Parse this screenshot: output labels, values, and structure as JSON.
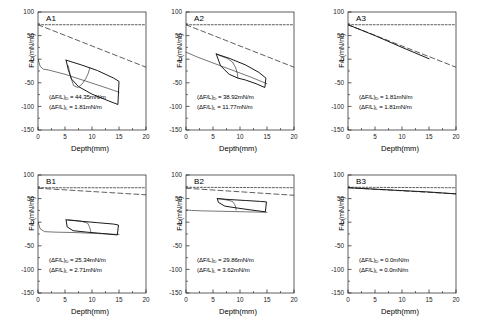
{
  "figure": {
    "width": 493,
    "height": 328,
    "background": "#ffffff",
    "line_color": "#1a1a1a",
    "rows": 2,
    "cols": 3
  },
  "axes": {
    "xlabel": "Depth(mm)",
    "ylabel": "F/L(mN/m)",
    "xticks": [
      0,
      5,
      10,
      15,
      20
    ],
    "yticks": [
      100,
      50,
      0,
      -50,
      -100,
      -150
    ],
    "xlim": [
      0,
      20
    ],
    "ylim": [
      -150,
      100
    ],
    "xtick_labels": [
      "0",
      "5",
      "10",
      "15",
      "20"
    ],
    "ytick_labels": [
      "100",
      "50",
      "0",
      "-50",
      "-100",
      "-150"
    ],
    "grid": false
  },
  "annotation_labels": {
    "delta_d_prefix": "(ΔF/L)",
    "delta_d_sub": "D",
    "delta_l_prefix": "(ΔF/L)",
    "delta_l_sub": "L",
    "equals": " = "
  },
  "chart_data": [
    {
      "id": "A1",
      "type": "line",
      "title": "A1",
      "xlabel": "Depth(mm)",
      "ylabel": "F/L(mN/m)",
      "xlim": [
        0,
        20
      ],
      "ylim": [
        -150,
        100
      ],
      "grid": false,
      "annotations": [
        {
          "label": "(ΔF/L)D",
          "value": "44.35mN/m",
          "text": "(ΔF/L)D = 44.35mN/m"
        },
        {
          "label": "(ΔF/L)L",
          "value": "1.81mN/m",
          "text": "(ΔF/L)L = 1.81mN/m"
        }
      ],
      "series": [
        {
          "name": "reference-horizontal-dashed",
          "style": "dashed",
          "x": [
            0,
            20
          ],
          "y": [
            73,
            73
          ]
        },
        {
          "name": "baseline-descending-dashed",
          "style": "dashed-long",
          "x": [
            0,
            20
          ],
          "y": [
            73,
            -17
          ]
        },
        {
          "name": "initial-descent-solid",
          "style": "solid-thin",
          "x": [
            0,
            0.4,
            1.0,
            2.0,
            5.0,
            9.0,
            13.0,
            15.0
          ],
          "y": [
            0,
            -15,
            -21,
            -23,
            -32,
            -47,
            -62,
            -70
          ]
        },
        {
          "name": "hysteresis-loop-outer",
          "style": "solid",
          "x": [
            5.2,
            8.0,
            11.0,
            14.0,
            15.0,
            14.8,
            13.0,
            10.0,
            7.5,
            6.2,
            5.6,
            5.2
          ],
          "y": [
            -2,
            -12,
            -24,
            -40,
            -47,
            -96,
            -88,
            -74,
            -58,
            -42,
            -22,
            -2
          ]
        },
        {
          "name": "hysteresis-loop-inner",
          "style": "solid-thin",
          "x": [
            9.6,
            9.3,
            8.8,
            8.2,
            7.4,
            6.6,
            6.0,
            5.6
          ],
          "y": [
            -18,
            -30,
            -42,
            -52,
            -60,
            -56,
            -36,
            -14
          ]
        }
      ]
    },
    {
      "id": "A2",
      "type": "line",
      "title": "A2",
      "xlabel": "Depth(mm)",
      "ylabel": "F/L(mN/m)",
      "xlim": [
        0,
        20
      ],
      "ylim": [
        -150,
        100
      ],
      "grid": false,
      "annotations": [
        {
          "label": "(ΔF/L)D",
          "value": "38.92mN/m",
          "text": "(ΔF/L)D = 38.92mN/m"
        },
        {
          "label": "(ΔF/L)L",
          "value": "11.77mN/m",
          "text": "(ΔF/L)L = 11.77mN/m"
        }
      ],
      "series": [
        {
          "name": "reference-horizontal-dashed",
          "style": "dashed",
          "x": [
            0,
            20
          ],
          "y": [
            73,
            73
          ]
        },
        {
          "name": "baseline-descending-dashed",
          "style": "dashed-long",
          "x": [
            0,
            20
          ],
          "y": [
            73,
            -17
          ]
        },
        {
          "name": "initial-descent-solid",
          "style": "solid-thin",
          "x": [
            0,
            2.0,
            5.0,
            9.0,
            12.0,
            15.0
          ],
          "y": [
            15,
            5,
            -8,
            -25,
            -38,
            -52
          ]
        },
        {
          "name": "hysteresis-loop-outer",
          "style": "solid",
          "x": [
            5.6,
            8.0,
            11.0,
            13.5,
            14.8,
            14.6,
            13.0,
            11.0,
            9.6,
            8.0,
            6.4,
            5.6
          ],
          "y": [
            11,
            2,
            -12,
            -28,
            -40,
            -60,
            -52,
            -44,
            -40,
            -32,
            -14,
            11
          ]
        },
        {
          "name": "hysteresis-loop-inner",
          "style": "solid-thin",
          "x": [
            9.6,
            9.5,
            9.2,
            8.6,
            7.6,
            6.6,
            6.0,
            5.7
          ],
          "y": [
            -40,
            -30,
            -18,
            -6,
            2,
            6,
            9,
            11
          ]
        }
      ]
    },
    {
      "id": "A3",
      "type": "line",
      "title": "A3",
      "xlabel": "Depth(mm)",
      "ylabel": "F/L(mN/m)",
      "xlim": [
        0,
        20
      ],
      "ylim": [
        -150,
        100
      ],
      "grid": false,
      "annotations": [
        {
          "label": "(ΔF/L)D",
          "value": "1.81mN/m",
          "text": "(ΔF/L)D = 1.81mN/m"
        },
        {
          "label": "(ΔF/L)L",
          "value": "1.81mN/m",
          "text": "(ΔF/L)L = 1.81mN/m"
        }
      ],
      "series": [
        {
          "name": "reference-horizontal-dashed",
          "style": "dashed",
          "x": [
            0,
            20
          ],
          "y": [
            73,
            73
          ]
        },
        {
          "name": "baseline-descending-dashed",
          "style": "dashed-long",
          "x": [
            0,
            20
          ],
          "y": [
            73,
            -17
          ]
        },
        {
          "name": "coincident-solid-line",
          "style": "solid",
          "x": [
            0,
            5,
            10,
            15
          ],
          "y": [
            73,
            50,
            25,
            1
          ]
        }
      ]
    },
    {
      "id": "B1",
      "type": "line",
      "title": "B1",
      "xlabel": "Depth(mm)",
      "ylabel": "F/L(mN/m)",
      "xlim": [
        0,
        20
      ],
      "ylim": [
        -150,
        100
      ],
      "grid": false,
      "annotations": [
        {
          "label": "(ΔF/L)D",
          "value": "25.34mN/m",
          "text": "(ΔF/L)D = 25.34mN/m"
        },
        {
          "label": "(ΔF/L)L",
          "value": "2.71mN/m",
          "text": "(ΔF/L)L = 2.71mN/m"
        }
      ],
      "series": [
        {
          "name": "reference-horizontal-dashed",
          "style": "dashed",
          "x": [
            0,
            20
          ],
          "y": [
            73,
            73
          ]
        },
        {
          "name": "baseline-descending-dashed",
          "style": "dashed-long",
          "x": [
            0,
            20
          ],
          "y": [
            72,
            58
          ]
        },
        {
          "name": "initial-descent-solid",
          "style": "solid-thin",
          "x": [
            0,
            0.4,
            1.2,
            3.0,
            7.0,
            11.0,
            15.0
          ],
          "y": [
            0,
            -14,
            -20,
            -21,
            -22,
            -24,
            -26
          ]
        },
        {
          "name": "hysteresis-loop-outer",
          "style": "solid",
          "x": [
            5.2,
            8.0,
            11.0,
            14.0,
            14.9,
            14.7,
            12.0,
            9.0,
            6.5,
            5.4,
            5.2
          ],
          "y": [
            5,
            2,
            -1,
            -4,
            -6,
            -27,
            -24,
            -21,
            -18,
            -10,
            5
          ]
        },
        {
          "name": "hysteresis-loop-inner",
          "style": "solid-thin",
          "x": [
            9.8,
            9.7,
            9.5,
            9.2,
            8.0,
            6.5,
            5.6
          ],
          "y": [
            -22,
            -16,
            -9,
            -2,
            2,
            4,
            5
          ]
        }
      ]
    },
    {
      "id": "B2",
      "type": "line",
      "title": "B2",
      "xlabel": "Depth(mm)",
      "ylabel": "F/L(mN/m)",
      "xlim": [
        0,
        20
      ],
      "ylim": [
        -150,
        100
      ],
      "grid": false,
      "annotations": [
        {
          "label": "(ΔF/L)D",
          "value": "29.86mN/m",
          "text": "(ΔF/L)D = 29.86mN/m"
        },
        {
          "label": "(ΔF/L)L",
          "value": "3.62mN/m",
          "text": "(ΔF/L)L = 3.62mN/m"
        }
      ],
      "series": [
        {
          "name": "reference-horizontal-dashed",
          "style": "dashed",
          "x": [
            0,
            20
          ],
          "y": [
            74,
            73
          ]
        },
        {
          "name": "baseline-descending-dashed",
          "style": "dashed-long",
          "x": [
            0,
            20
          ],
          "y": [
            72,
            57
          ]
        },
        {
          "name": "initial-descent-solid",
          "style": "solid-thin",
          "x": [
            0,
            1.0,
            3.0,
            7.0,
            11.0,
            15.0
          ],
          "y": [
            26,
            25,
            24,
            23,
            22,
            21
          ]
        },
        {
          "name": "hysteresis-loop-outer",
          "style": "solid",
          "x": [
            5.8,
            8.0,
            11.0,
            13.8,
            14.9,
            14.7,
            12.0,
            9.5,
            7.2,
            6.0,
            5.8
          ],
          "y": [
            50,
            48,
            46,
            44,
            43,
            22,
            26,
            30,
            34,
            42,
            50
          ]
        },
        {
          "name": "hysteresis-loop-inner",
          "style": "solid-thin",
          "x": [
            9.3,
            9.2,
            9.0,
            8.6,
            7.6,
            6.6,
            6.0
          ],
          "y": [
            26,
            32,
            38,
            44,
            47,
            49,
            50
          ]
        }
      ]
    },
    {
      "id": "B3",
      "type": "line",
      "title": "B3",
      "xlabel": "Depth(mm)",
      "ylabel": "F/L(mN/m)",
      "xlim": [
        0,
        20
      ],
      "ylim": [
        -150,
        100
      ],
      "grid": false,
      "annotations": [
        {
          "label": "(ΔF/L)D",
          "value": "0.0mN/m",
          "text": "(ΔF/L)D = 0.0mN/m"
        },
        {
          "label": "(ΔF/L)L",
          "value": "0.0mN/m",
          "text": "(ΔF/L)L = 0.0mN/m"
        }
      ],
      "series": [
        {
          "name": "reference-horizontal-dashed",
          "style": "dashed",
          "x": [
            0,
            20
          ],
          "y": [
            74,
            73
          ]
        },
        {
          "name": "baseline-descending-dashed",
          "style": "dashed-long",
          "x": [
            0,
            20
          ],
          "y": [
            73,
            60
          ]
        },
        {
          "name": "coincident-solid-line",
          "style": "solid",
          "x": [
            0,
            5,
            10,
            15,
            20
          ],
          "y": [
            73,
            70,
            67,
            64,
            60
          ]
        }
      ]
    }
  ]
}
